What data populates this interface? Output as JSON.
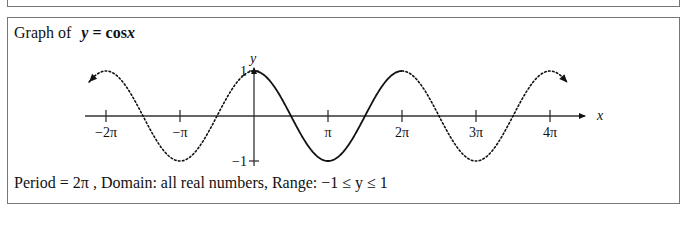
{
  "title": {
    "prefix": "Graph of",
    "equation": "y = cos x",
    "eq_var": "y",
    "eq_eq": " = ",
    "eq_fn": "cos",
    "eq_arg": "x"
  },
  "footer": {
    "text": "Period = 2π ,  Domain:  all real numbers,  Range:   −1 ≤ y ≤ 1"
  },
  "chart_data": {
    "type": "line",
    "xlabel": "x",
    "ylabel": "y",
    "x_ticks": [
      -6.2832,
      -3.1416,
      3.1416,
      6.2832,
      9.4248,
      12.5664
    ],
    "x_tick_labels": [
      "−2π",
      "−π",
      "π",
      "2π",
      "3π",
      "4π"
    ],
    "y_ticks": [
      1,
      -1
    ],
    "y_tick_labels": [
      "1",
      "−1"
    ],
    "xlim": [
      -7.2,
      13.9
    ],
    "ylim": [
      -1,
      1
    ],
    "grid": false,
    "series": [
      {
        "name": "cos x (one period, solid)",
        "style": "solid",
        "x_range": [
          0,
          6.2832
        ],
        "function": "cos(x)",
        "x": [
          0,
          1.5708,
          3.1416,
          4.7124,
          6.2832
        ],
        "values": [
          1,
          0,
          -1,
          0,
          1
        ]
      },
      {
        "name": "cos x (extension, dotted left)",
        "style": "dotted",
        "x_range": [
          -7.0,
          0
        ],
        "function": "cos(x)",
        "x": [
          -6.2832,
          -4.7124,
          -3.1416,
          -1.5708,
          0
        ],
        "values": [
          1,
          0,
          -1,
          0,
          1
        ]
      },
      {
        "name": "cos x (extension, dotted right)",
        "style": "dotted",
        "x_range": [
          6.2832,
          13.3
        ],
        "function": "cos(x)",
        "x": [
          6.2832,
          7.854,
          9.4248,
          10.9956,
          12.5664
        ],
        "values": [
          1,
          0,
          -1,
          0,
          1
        ]
      }
    ],
    "annotations": [
      "arrowheads at both dotted ends indicating continuation"
    ]
  },
  "colors": {
    "curve": "#111111",
    "axis": "#333333",
    "border": "#777777"
  }
}
